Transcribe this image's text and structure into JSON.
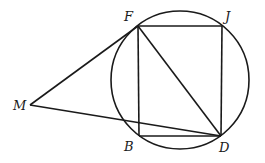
{
  "diagram": {
    "type": "geometry",
    "circle": {
      "cx": 180,
      "cy": 80,
      "r": 69
    },
    "points": {
      "F": {
        "x": 138,
        "y": 26,
        "label": "F",
        "lx": 124,
        "ly": 21
      },
      "J": {
        "x": 222,
        "y": 26,
        "label": "J",
        "lx": 225,
        "ly": 21
      },
      "D": {
        "x": 221,
        "y": 136,
        "label": "D",
        "lx": 219,
        "ly": 152
      },
      "B": {
        "x": 139,
        "y": 136,
        "label": "B",
        "lx": 124,
        "ly": 151
      },
      "M": {
        "x": 30,
        "y": 105,
        "label": "M",
        "lx": 13,
        "ly": 110
      }
    },
    "segments": [
      [
        "F",
        "J"
      ],
      [
        "J",
        "D"
      ],
      [
        "D",
        "B"
      ],
      [
        "B",
        "F"
      ],
      [
        "F",
        "D"
      ],
      [
        "M",
        "F"
      ],
      [
        "M",
        "D"
      ]
    ],
    "labels": {
      "F": "F",
      "J": "J",
      "D": "D",
      "B": "B",
      "M": "M"
    }
  }
}
